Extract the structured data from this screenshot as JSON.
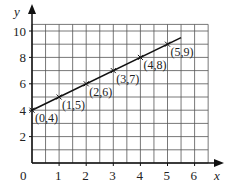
{
  "chart_data": {
    "type": "line",
    "title": "",
    "xlabel": "x",
    "ylabel": "y",
    "xlim": [
      0,
      6.5
    ],
    "ylim": [
      0,
      10.5
    ],
    "grid": true,
    "grid_step_x": 0.5,
    "grid_step_y": 1,
    "x_ticks": [
      0,
      1,
      2,
      3,
      4,
      5,
      6
    ],
    "y_ticks": [
      2,
      4,
      6,
      8,
      10
    ],
    "x_tick_labels": [
      "0",
      "1",
      "2",
      "3",
      "4",
      "5",
      "6"
    ],
    "y_tick_labels": [
      "2",
      "4",
      "6",
      "8",
      "10"
    ],
    "series": [
      {
        "name": "y = x + 4",
        "x": [
          0,
          1,
          2,
          3,
          4,
          5
        ],
        "y": [
          4,
          5,
          6,
          7,
          8,
          9
        ],
        "line_extent": [
          0,
          5.5
        ],
        "marker": "x",
        "color": "#111111"
      }
    ],
    "annotations": [
      "(0,4)",
      "(1,5)",
      "(2,6)",
      "(3,7)",
      "(4,8)",
      "(5,9)"
    ]
  }
}
